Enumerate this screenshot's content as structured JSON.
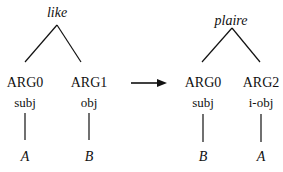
{
  "left_tree": {
    "root": "like",
    "children": [
      {
        "arg": "ARG0",
        "role": "subj",
        "leaf": "A"
      },
      {
        "arg": "ARG1",
        "role": "obj",
        "leaf": "B"
      }
    ]
  },
  "arrow": {
    "direction": "right"
  },
  "right_tree": {
    "root": "plaire",
    "children": [
      {
        "arg": "ARG0",
        "role": "subj",
        "leaf": "B"
      },
      {
        "arg": "ARG2",
        "role": "i-obj",
        "leaf": "A"
      }
    ]
  }
}
